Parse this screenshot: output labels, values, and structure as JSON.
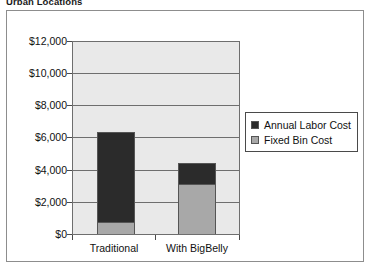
{
  "chart_title": "Urban Locations",
  "legend": {
    "position": "right",
    "entries": [
      {
        "label": "Annual Labor Cost",
        "color": "#2b2b2b"
      },
      {
        "label": "Fixed Bin Cost",
        "color": "#a8a8a8"
      }
    ]
  },
  "axes": {
    "y_ticks": [
      "$0",
      "$2,000",
      "$4,000",
      "$6,000",
      "$8,000",
      "$10,000",
      "$12,000"
    ],
    "x_ticks": [
      "Traditional",
      "With BigBelly"
    ]
  },
  "chart_data": {
    "type": "bar",
    "stacked": true,
    "title": "Urban Locations",
    "xlabel": "",
    "ylabel": "",
    "categories": [
      "Traditional",
      "With BigBelly"
    ],
    "series": [
      {
        "name": "Fixed Bin Cost",
        "color": "#a8a8a8",
        "values": [
          750,
          3100
        ]
      },
      {
        "name": "Annual Labor Cost",
        "color": "#2b2b2b",
        "values": [
          5600,
          1300
        ]
      }
    ],
    "totals": [
      6350,
      4400
    ],
    "ylim": [
      0,
      12000
    ],
    "ytick_values": [
      0,
      2000,
      4000,
      6000,
      8000,
      10000,
      12000
    ],
    "ytick_labels": [
      "$0",
      "$2,000",
      "$4,000",
      "$6,000",
      "$8,000",
      "$10,000",
      "$12,000"
    ],
    "grid": true,
    "grid_axis": "y",
    "legend_position": "right",
    "currency": "USD"
  },
  "colors": {
    "plot_background": "#e9e9e9",
    "grid": "#6e6e6e",
    "frame": "#8d8d8d",
    "text": "#111111"
  }
}
